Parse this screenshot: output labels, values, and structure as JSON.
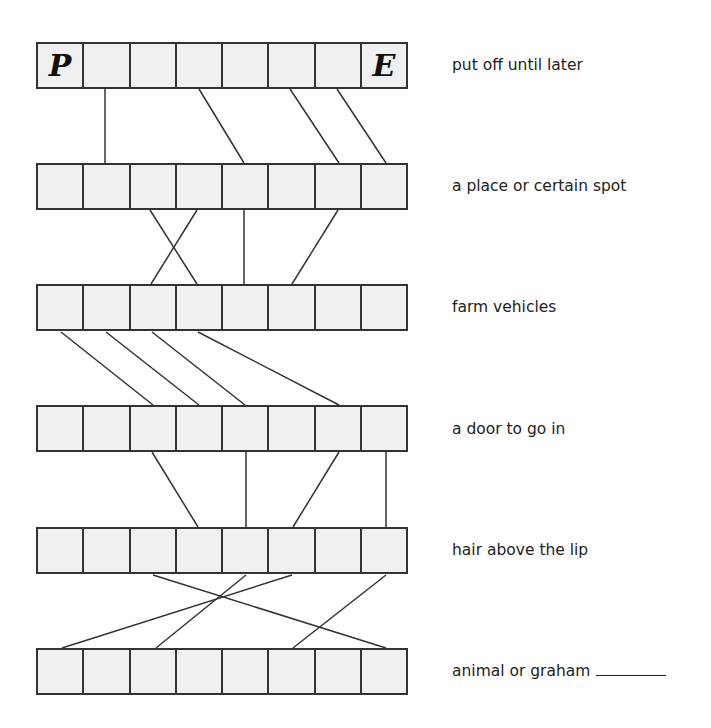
{
  "puzzle": {
    "rows": [
      {
        "clue": "put off until later",
        "letters": [
          "P",
          "",
          "",
          "",
          "",
          "",
          "",
          "E"
        ],
        "has_blank": false
      },
      {
        "clue": "a place or certain spot",
        "letters": [
          "",
          "",
          "",
          "",
          "",
          "",
          "",
          ""
        ],
        "has_blank": false
      },
      {
        "clue": "farm vehicles",
        "letters": [
          "",
          "",
          "",
          "",
          "",
          "",
          "",
          ""
        ],
        "has_blank": false
      },
      {
        "clue": "a door to go in",
        "letters": [
          "",
          "",
          "",
          "",
          "",
          "",
          "",
          ""
        ],
        "has_blank": false
      },
      {
        "clue": "hair above the lip",
        "letters": [
          "",
          "",
          "",
          "",
          "",
          "",
          "",
          ""
        ],
        "has_blank": false
      },
      {
        "clue": "animal or graham",
        "letters": [
          "",
          "",
          "",
          "",
          "",
          "",
          "",
          ""
        ],
        "has_blank": true
      }
    ],
    "connections": [
      [
        [
          105,
          89
        ],
        [
          105,
          163
        ]
      ],
      [
        [
          199,
          89
        ],
        [
          244,
          163
        ]
      ],
      [
        [
          290,
          89
        ],
        [
          339,
          163
        ]
      ],
      [
        [
          337,
          89
        ],
        [
          386,
          163
        ]
      ],
      [
        [
          150,
          210
        ],
        [
          197,
          284
        ]
      ],
      [
        [
          197,
          210
        ],
        [
          151,
          284
        ]
      ],
      [
        [
          244,
          210
        ],
        [
          244,
          284
        ]
      ],
      [
        [
          338,
          210
        ],
        [
          292,
          284
        ]
      ],
      [
        [
          61,
          332
        ],
        [
          153,
          405
        ]
      ],
      [
        [
          106,
          332
        ],
        [
          199,
          405
        ]
      ],
      [
        [
          152,
          332
        ],
        [
          245,
          405
        ]
      ],
      [
        [
          198,
          332
        ],
        [
          339,
          405
        ]
      ],
      [
        [
          152,
          452
        ],
        [
          198,
          527
        ]
      ],
      [
        [
          246,
          452
        ],
        [
          246,
          527
        ]
      ],
      [
        [
          339,
          452
        ],
        [
          293,
          527
        ]
      ],
      [
        [
          386,
          452
        ],
        [
          386,
          527
        ]
      ],
      [
        [
          153,
          575
        ],
        [
          386,
          648
        ]
      ],
      [
        [
          246,
          575
        ],
        [
          156,
          648
        ]
      ],
      [
        [
          292,
          575
        ],
        [
          62,
          648
        ]
      ],
      [
        [
          386,
          575
        ],
        [
          293,
          648
        ]
      ]
    ],
    "colors": {
      "cell_fill": "#f0f0f0",
      "border": "#333333",
      "line": "#333333",
      "text": "#222222"
    }
  }
}
